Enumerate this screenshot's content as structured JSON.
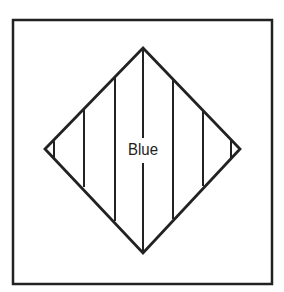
{
  "diagram": {
    "label": "Blue",
    "stroke_color": "#222222",
    "background_color": "#ffffff",
    "frame": {
      "x1": 13,
      "y1": 20,
      "x2": 272,
      "y2": 284
    },
    "diamond": {
      "top": [
        143,
        48
      ],
      "right": [
        240,
        149
      ],
      "bottom": [
        143,
        253
      ],
      "left": [
        45,
        149
      ]
    },
    "stripe_count": 7
  }
}
